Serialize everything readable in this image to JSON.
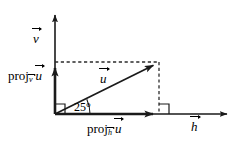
{
  "figure": {
    "name": "vector-projection-diagram",
    "background_color": "#ffffff",
    "stroke_color": "#1a1a1a",
    "dashed_color": "#2b2b2b",
    "width": 243,
    "height": 146
  },
  "labels": {
    "vertical_axis": {
      "text": "v",
      "accent": "vector-arrow"
    },
    "horizontal_axis": {
      "text": "h",
      "accent": "vector-arrow"
    },
    "main_vector": {
      "text": "u",
      "accent": "vector-arrow"
    },
    "projection_onto_v": {
      "prefix": "proj",
      "subscript": "v",
      "operand": "u"
    },
    "projection_onto_h": {
      "prefix": "proj",
      "subscript": "h",
      "operand": "u"
    },
    "angle": {
      "text": "25°",
      "value": 25,
      "unit": "degrees"
    }
  },
  "geometry": {
    "origin": {
      "x": 55,
      "y": 114
    },
    "vertical_axis_tip": {
      "x": 55,
      "y": 14
    },
    "horizontal_axis_tip": {
      "x": 228,
      "y": 114
    },
    "vector_u_tip": {
      "x": 159,
      "y": 62
    },
    "projection_v_tip": {
      "x": 55,
      "y": 62
    },
    "projection_h_tip": {
      "x": 160,
      "y": 114
    },
    "right_angle_markers": [
      {
        "name": "origin-right-angle",
        "x": 55,
        "y": 114
      },
      {
        "name": "foot-right-angle",
        "x": 160,
        "y": 114
      }
    ],
    "dashed_lines": [
      {
        "name": "dashed-top",
        "from": [
          55,
          62
        ],
        "to": [
          159,
          62
        ]
      },
      {
        "name": "dashed-right",
        "from": [
          159,
          62
        ],
        "to": [
          159,
          114
        ]
      }
    ]
  }
}
